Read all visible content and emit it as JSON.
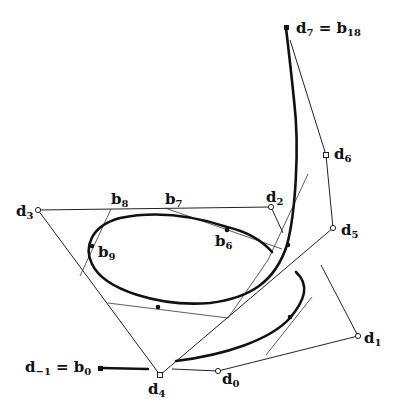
{
  "figure": {
    "labels": {
      "d_minus1_eq_b0": {
        "main": "d",
        "sub": "−1",
        "eq": " = ",
        "main2": "b",
        "sub2": "0"
      },
      "d0": {
        "main": "d",
        "sub": "0"
      },
      "d1": {
        "main": "d",
        "sub": "1"
      },
      "d2": {
        "main": "d",
        "sub": "2"
      },
      "d3": {
        "main": "d",
        "sub": "3"
      },
      "d4": {
        "main": "d",
        "sub": "4"
      },
      "d5": {
        "main": "d",
        "sub": "5"
      },
      "d6": {
        "main": "d",
        "sub": "6"
      },
      "d7_eq_b18": {
        "main": "d",
        "sub": "7",
        "eq": " = ",
        "main2": "b",
        "sub2": "18"
      },
      "b6": {
        "main": "b",
        "sub": "6"
      },
      "b7": {
        "main": "b",
        "sub": "7"
      },
      "b8": {
        "main": "b",
        "sub": "8"
      },
      "b9": {
        "main": "b",
        "sub": "9"
      }
    },
    "colors": {
      "curve": "#111111",
      "polygon": "#222222",
      "background": "#ffffff"
    }
  }
}
